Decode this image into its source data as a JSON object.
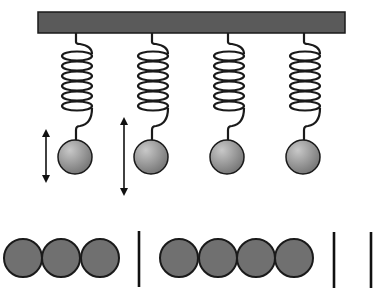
{
  "diagram": {
    "type": "mass-spring oscillators",
    "colors": {
      "background": "#ffffff",
      "bar_fill": "#5a5a5a",
      "stroke": "#1a1a1a",
      "ball_light": "#c8c8c8",
      "ball_dark": "#6e6e6e",
      "bottom_circle_fill": "#707070"
    },
    "support_bar": {
      "x": 38,
      "y": 12,
      "width": 307,
      "height": 21
    },
    "oscillators": [
      {
        "id": 1,
        "x": 76,
        "ball_y": 157,
        "ball_r": 17,
        "arrow": {
          "x": 46,
          "y1": 129,
          "y2": 183
        }
      },
      {
        "id": 2,
        "x": 152,
        "ball_y": 157,
        "ball_r": 17,
        "arrow": {
          "x": 124,
          "y1": 117,
          "y2": 196
        }
      },
      {
        "id": 3,
        "x": 228,
        "ball_y": 157,
        "ball_r": 17,
        "arrow": null
      },
      {
        "id": 4,
        "x": 304,
        "ball_y": 157,
        "ball_r": 17,
        "arrow": null
      }
    ],
    "spring": {
      "coils": 6,
      "coil_top": 56,
      "coil_spacing": 10,
      "coil_rx": 15,
      "coil_ry": 4.5
    },
    "bottom_row": {
      "circle_y": 258,
      "circle_r": 19,
      "circles_x": [
        23,
        61,
        100,
        179,
        218,
        256,
        294
      ],
      "dividers": [
        {
          "x": 139,
          "y1": 231,
          "y2": 287
        },
        {
          "x": 334,
          "y1": 232,
          "y2": 288
        },
        {
          "x": 371,
          "y1": 232,
          "y2": 288
        }
      ]
    }
  }
}
